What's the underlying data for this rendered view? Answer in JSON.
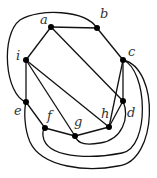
{
  "diagram": {
    "type": "graph",
    "vertices": [
      {
        "id": "a",
        "label": "a"
      },
      {
        "id": "b",
        "label": "b"
      },
      {
        "id": "c",
        "label": "c"
      },
      {
        "id": "d",
        "label": "d"
      },
      {
        "id": "e",
        "label": "e"
      },
      {
        "id": "f",
        "label": "f"
      },
      {
        "id": "g",
        "label": "g"
      },
      {
        "id": "h",
        "label": "h"
      },
      {
        "id": "i",
        "label": "i"
      }
    ],
    "edges": [
      {
        "from": "a",
        "to": "b"
      },
      {
        "from": "a",
        "to": "i"
      },
      {
        "from": "a",
        "to": "d"
      },
      {
        "from": "b",
        "to": "c"
      },
      {
        "from": "b",
        "to": "e",
        "curved": true
      },
      {
        "from": "c",
        "to": "h"
      },
      {
        "from": "c",
        "to": "d"
      },
      {
        "from": "c",
        "to": "f",
        "curved": true
      },
      {
        "from": "c",
        "to": "e",
        "curved": true
      },
      {
        "from": "d",
        "to": "h"
      },
      {
        "from": "d",
        "to": "g",
        "curved": true
      },
      {
        "from": "i",
        "to": "e"
      },
      {
        "from": "i",
        "to": "g"
      },
      {
        "from": "i",
        "to": "h"
      },
      {
        "from": "e",
        "to": "f"
      },
      {
        "from": "f",
        "to": "g"
      },
      {
        "from": "g",
        "to": "h"
      }
    ]
  }
}
